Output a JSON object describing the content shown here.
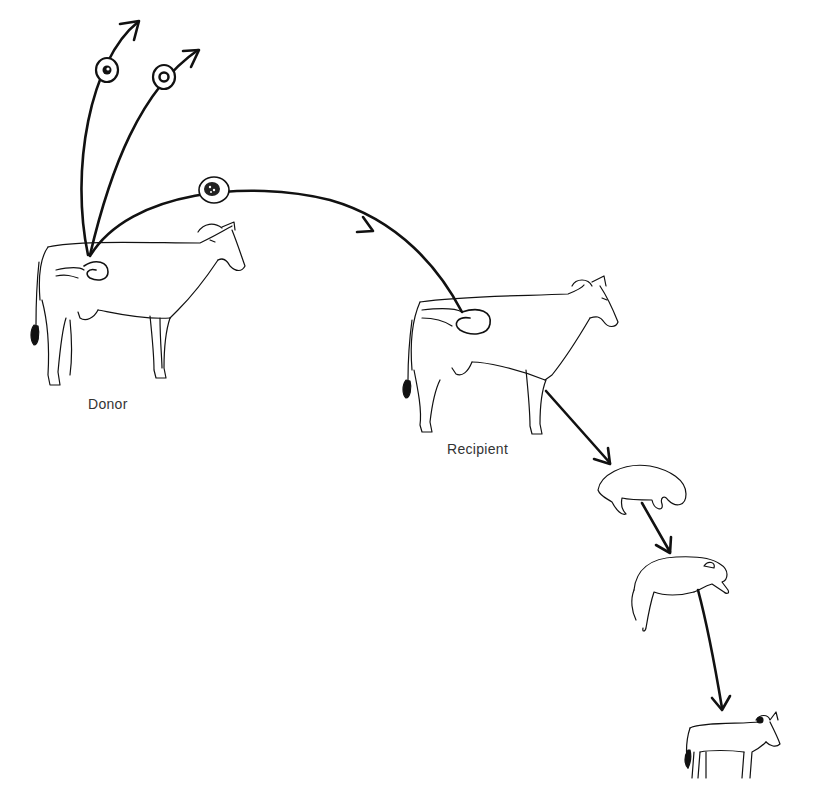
{
  "diagram": {
    "type": "embryo-transfer-process",
    "labels": {
      "donor": "Donor",
      "recipient": "Recipient"
    },
    "stages": [
      {
        "id": "donor-cow",
        "label": "Donor"
      },
      {
        "id": "embryos-collected",
        "count": 3
      },
      {
        "id": "recipient-cow",
        "label": "Recipient"
      },
      {
        "id": "fetus-early"
      },
      {
        "id": "fetus-late"
      },
      {
        "id": "calf"
      }
    ],
    "colors": {
      "ink": "#111111",
      "label": "#333333",
      "background": "#ffffff"
    }
  }
}
